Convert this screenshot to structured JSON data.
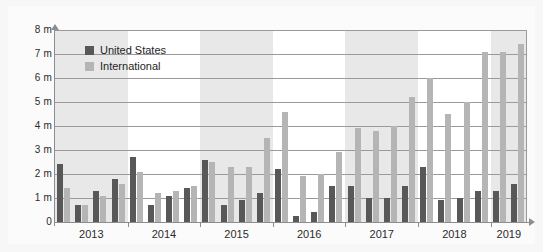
{
  "chart_data": {
    "type": "bar",
    "title": "",
    "xlabel": "",
    "ylabel": "",
    "ylim": [
      0,
      8
    ],
    "ytick_labels": [
      "8 m",
      "7 m",
      "6 m",
      "5 m",
      "4 m",
      "3 m",
      "2 m",
      "1 m",
      "0"
    ],
    "ytick_values": [
      8,
      7,
      6,
      5,
      4,
      3,
      2,
      1,
      0
    ],
    "grid": true,
    "legend_position": "top-left",
    "categories": [
      "2013 Q1",
      "2013 Q2",
      "2013 Q3",
      "2013 Q4",
      "2014 Q1",
      "2014 Q2",
      "2014 Q3",
      "2014 Q4",
      "2015 Q1",
      "2015 Q2",
      "2015 Q3",
      "2015 Q4",
      "2016 Q1",
      "2016 Q2",
      "2016 Q3",
      "2016 Q4",
      "2017 Q1",
      "2017 Q2",
      "2017 Q3",
      "2017 Q4",
      "2018 Q1",
      "2018 Q2",
      "2018 Q3",
      "2018 Q4",
      "2019 Q1",
      "2019 Q2"
    ],
    "year_labels": [
      "2013",
      "2014",
      "2015",
      "2016",
      "2017",
      "2018",
      "2019"
    ],
    "series": [
      {
        "name": "United States",
        "color": "#585858",
        "values": [
          2.4,
          0.7,
          1.3,
          1.8,
          2.7,
          0.7,
          1.1,
          1.4,
          2.6,
          0.7,
          0.9,
          1.2,
          2.2,
          0.25,
          0.4,
          1.5,
          1.5,
          1.0,
          1.0,
          1.5,
          2.3,
          0.9,
          1.0,
          1.3,
          1.3,
          1.6
        ]
      },
      {
        "name": "International",
        "color": "#b5b5b5",
        "values": [
          1.4,
          0.7,
          1.1,
          1.6,
          2.1,
          1.2,
          1.3,
          1.5,
          2.5,
          2.3,
          2.3,
          3.5,
          4.6,
          1.9,
          2.0,
          2.9,
          3.9,
          3.8,
          4.0,
          5.2,
          6.0,
          4.5,
          5.0,
          7.1,
          7.1,
          7.4
        ]
      }
    ]
  },
  "legend": {
    "items": [
      {
        "label": "United States",
        "color": "#585858"
      },
      {
        "label": "International",
        "color": "#b5b5b5"
      }
    ]
  }
}
